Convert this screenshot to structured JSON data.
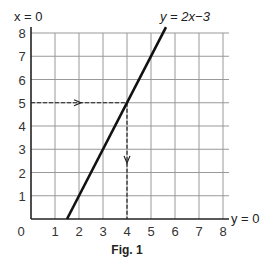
{
  "chart_data": {
    "type": "line",
    "title": "",
    "caption": "Fig. 1",
    "equation_label": "y = 2x−3",
    "yaxis_label": "x = 0",
    "xaxis_label": "y = 0",
    "xlabel": "",
    "ylabel": "",
    "xlim": [
      0,
      8
    ],
    "ylim": [
      0,
      8
    ],
    "grid": true,
    "x_ticks": [
      "0",
      "1",
      "2",
      "3",
      "4",
      "5",
      "6",
      "7",
      "8"
    ],
    "y_ticks": [
      "1",
      "2",
      "3",
      "4",
      "5",
      "6",
      "7",
      "8"
    ],
    "series": [
      {
        "name": "y = 2x−3",
        "x": [
          1.5,
          5.5
        ],
        "y": [
          0,
          8
        ],
        "style": "solid"
      }
    ],
    "annotations": [
      {
        "type": "dashed-arrow",
        "from": [
          0,
          5
        ],
        "to": [
          4,
          5
        ],
        "direction": "right"
      },
      {
        "type": "dashed-arrow",
        "from": [
          4,
          5
        ],
        "to": [
          4,
          0
        ],
        "direction": "down"
      }
    ]
  }
}
